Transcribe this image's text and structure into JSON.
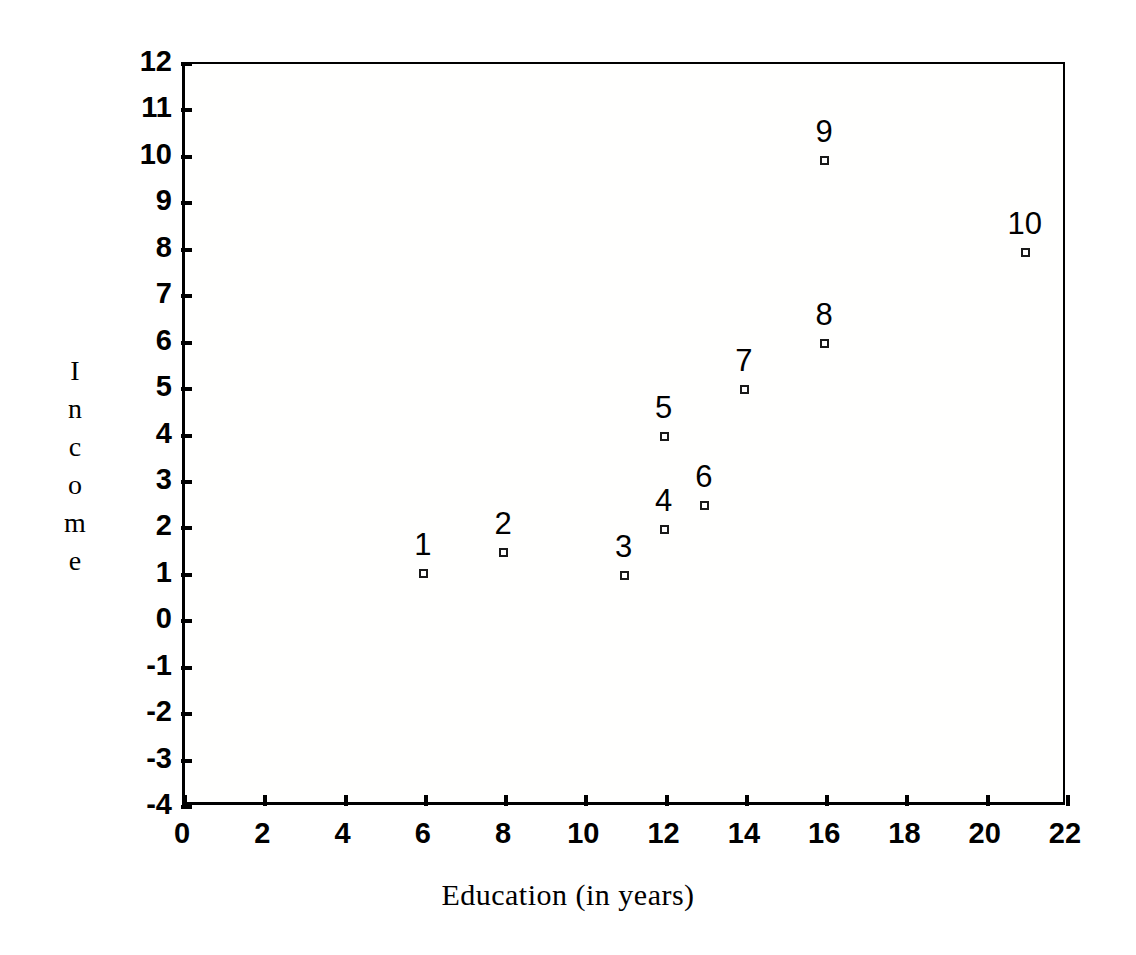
{
  "chart_data": {
    "type": "scatter",
    "title": "",
    "xlabel": "Education (in years)",
    "ylabel": "Income",
    "ylabel_letters": [
      "I",
      "n",
      "c",
      "o",
      "m",
      "e"
    ],
    "xlim": [
      0,
      22
    ],
    "ylim": [
      -4,
      12
    ],
    "xticks": [
      0,
      2,
      4,
      6,
      8,
      10,
      12,
      14,
      16,
      18,
      20,
      22
    ],
    "yticks": [
      -4,
      -3,
      -2,
      -1,
      0,
      1,
      2,
      3,
      4,
      5,
      6,
      7,
      8,
      9,
      10,
      11,
      12
    ],
    "xtick_labels": [
      "0",
      "2",
      "4",
      "6",
      "8",
      "10",
      "12",
      "14",
      "16",
      "18",
      "20",
      "22"
    ],
    "ytick_labels": [
      "-4",
      "-3",
      "-2",
      "-1",
      "0",
      "1",
      "2",
      "3",
      "4",
      "5",
      "6",
      "7",
      "8",
      "9",
      "10",
      "11",
      "12"
    ],
    "grid": false,
    "legend": false,
    "marker_style": "open-square",
    "marker_color": "#1a1a1a",
    "point_labels_position": "above",
    "points": [
      {
        "label": "1",
        "x": 6,
        "y": 1.0
      },
      {
        "label": "2",
        "x": 8,
        "y": 1.45
      },
      {
        "label": "3",
        "x": 11,
        "y": 0.95
      },
      {
        "label": "4",
        "x": 12,
        "y": 1.95
      },
      {
        "label": "5",
        "x": 12,
        "y": 3.95
      },
      {
        "label": "6",
        "x": 13,
        "y": 2.45
      },
      {
        "label": "7",
        "x": 14,
        "y": 4.95
      },
      {
        "label": "8",
        "x": 16,
        "y": 5.95
      },
      {
        "label": "9",
        "x": 16,
        "y": 9.9
      },
      {
        "label": "10",
        "x": 21,
        "y": 7.9
      }
    ]
  },
  "geometry": {
    "plot_left": 182,
    "plot_top": 62,
    "plot_width": 883,
    "plot_height": 743
  }
}
